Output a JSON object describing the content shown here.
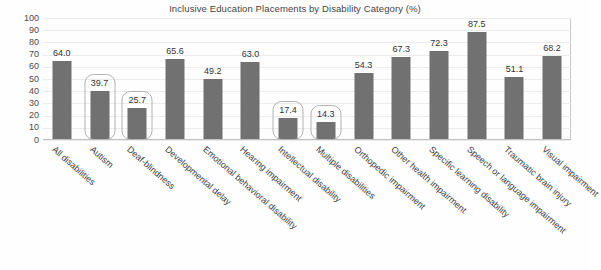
{
  "chart_data": {
    "type": "bar",
    "title": "Inclusive Education Placements by Disability Category (%)",
    "xlabel": "",
    "ylabel": "",
    "ylim": [
      0,
      100
    ],
    "ytick_step": 10,
    "yticks": [
      "100",
      "90",
      "80",
      "70",
      "60",
      "50",
      "40",
      "30",
      "20",
      "10",
      "0"
    ],
    "grid": true,
    "legend": null,
    "bar_color": "#717171",
    "highlight_stroke_color": "#b2b2b2",
    "gridline_color": "#ebebeb",
    "categories": [
      "All disabilities",
      "Autism",
      "Deaf-blindness",
      "Developmental delay",
      "Emotional behavioral disability",
      "Hearing impairment",
      "Intellectual disability",
      "Multiple disabilities",
      "Orthopedic impairment",
      "Other health impairment",
      "Specific learning disability",
      "Speech or language impairment",
      "Traumatic brain injury",
      "Visual impairment"
    ],
    "values": [
      64.0,
      39.7,
      25.7,
      65.6,
      49.2,
      63.0,
      17.4,
      14.3,
      54.3,
      67.3,
      72.3,
      87.5,
      51.1,
      68.2
    ],
    "data_labels": [
      "64.0",
      "39.7",
      "25.7",
      "65.6",
      "49.2",
      "63.0",
      "17.4",
      "14.3",
      "54.3",
      "67.3",
      "72.3",
      "87.5",
      "51.1",
      "68.2"
    ],
    "highlighted": [
      false,
      true,
      true,
      false,
      false,
      false,
      true,
      true,
      false,
      false,
      false,
      false,
      false,
      false
    ]
  }
}
